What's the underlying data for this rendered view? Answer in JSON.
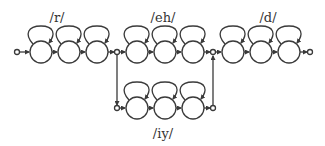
{
  "diagram": {
    "type": "hmm-pronunciation-network",
    "colors": {
      "stroke": "#3a3a3a",
      "text": "#333333",
      "background": "#ffffff"
    },
    "phones": [
      {
        "id": "r",
        "label": "/r/",
        "states": 3,
        "row": "top"
      },
      {
        "id": "eh",
        "label": "/eh/",
        "states": 3,
        "row": "top"
      },
      {
        "id": "iy",
        "label": "/iy/",
        "states": 3,
        "row": "bottom"
      },
      {
        "id": "d",
        "label": "/d/",
        "states": 3,
        "row": "top"
      }
    ],
    "labels": {
      "r": "/r/",
      "eh": "/eh/",
      "iy": "/iy/",
      "d": "/d/"
    }
  }
}
